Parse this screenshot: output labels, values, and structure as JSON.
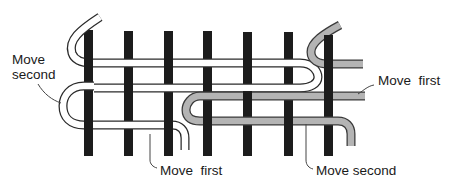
{
  "diagram": {
    "title": "",
    "colors": {
      "bar": "#1c1c1c",
      "white_strand_fill": "#ffffff",
      "white_strand_outline": "#2a2a2a",
      "gray_strand_fill": "#b4b4b4",
      "gray_strand_outline": "#3a3a3a",
      "leader": "#444444"
    },
    "vertical_bars": 7,
    "labels": {
      "move_second_left": "Move\nsecond",
      "move_first_bottom": "Move  first",
      "move_first_right": "Move  first",
      "move_second_bottom": "Move second"
    }
  }
}
